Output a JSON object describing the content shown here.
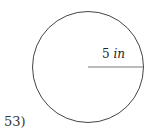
{
  "problem": {
    "number": "53)",
    "shape": "circle",
    "measurement": {
      "value": "5",
      "unit": "in",
      "type": "radius"
    }
  }
}
